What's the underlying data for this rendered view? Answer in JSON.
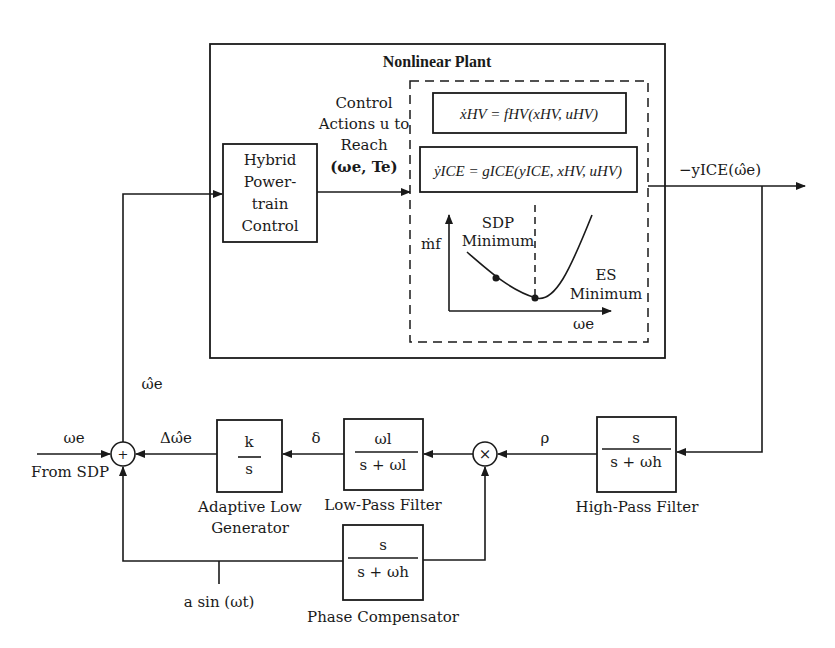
{
  "plant": {
    "title": "Nonlinear Plant",
    "control_actions": [
      "Control",
      "Actions u to",
      "Reach",
      "(ωe, Te)"
    ],
    "equation_hv": "ẋHV = fHV(xHV, uHV)",
    "equation_ice": "ẏICE = gICE(yICE, xHV, uHV)",
    "inset_plot": {
      "ylabel": "ṁf",
      "xlabel": "ωe",
      "sdp_label": [
        "SDP",
        "Minimum"
      ],
      "es_label": [
        "ES",
        "Minimum"
      ]
    }
  },
  "blocks": {
    "hybrid_powertrain": [
      "Hybrid",
      "Power-",
      "train",
      "Control"
    ],
    "integrator": {
      "num": "k",
      "den": "s",
      "caption": [
        "Adaptive Low",
        "Generator"
      ]
    },
    "low_pass": {
      "num": "ωl",
      "den": "s + ωl",
      "caption": "Low-Pass Filter"
    },
    "high_pass": {
      "num": "s",
      "den": "s + ωh",
      "caption": "High-Pass Filter"
    },
    "phase_comp": {
      "num": "s",
      "den": "s + ωh",
      "caption": "Phase Compensator"
    }
  },
  "signals": {
    "output": "−yICE(ω̂e)",
    "omega_hat": "ω̂e",
    "delta_omega_hat": "Δω̂e",
    "delta": "δ",
    "rho": "ρ",
    "omega_e": "ωe",
    "from_sdp": "From SDP",
    "dither": "a sin (ωt)"
  },
  "junctions": {
    "sum": "+",
    "multiply": "×"
  }
}
